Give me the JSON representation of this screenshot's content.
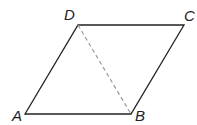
{
  "diagram": {
    "type": "parallelogram",
    "vertices": {
      "A": {
        "label": "A",
        "x": 25,
        "y": 114
      },
      "B": {
        "label": "B",
        "x": 131,
        "y": 114
      },
      "C": {
        "label": "C",
        "x": 184,
        "y": 25
      },
      "D": {
        "label": "D",
        "x": 78,
        "y": 25
      }
    },
    "edges": [
      [
        "A",
        "B"
      ],
      [
        "B",
        "C"
      ],
      [
        "C",
        "D"
      ],
      [
        "D",
        "A"
      ]
    ],
    "dashed_segments": [
      [
        "D",
        "B"
      ]
    ],
    "colors": {
      "line": "#222222",
      "dashed": "#999999"
    }
  }
}
